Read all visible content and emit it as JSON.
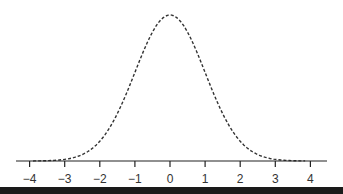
{
  "chart_data": {
    "type": "line",
    "title": "",
    "xlabel": "",
    "ylabel": "",
    "series": [
      {
        "name": "standard normal density",
        "style": "dashed",
        "color": "#333333",
        "function": "normal_pdf",
        "mean": 0,
        "sd": 1,
        "x": [
          -4,
          -3.5,
          -3,
          -2.5,
          -2,
          -1.5,
          -1,
          -0.5,
          0,
          0.5,
          1,
          1.5,
          2,
          2.5,
          3,
          3.5,
          4
        ],
        "values": [
          0.0001,
          0.0009,
          0.0044,
          0.0175,
          0.054,
          0.1295,
          0.242,
          0.3521,
          0.3989,
          0.3521,
          0.242,
          0.1295,
          0.054,
          0.0175,
          0.0044,
          0.0009,
          0.0001
        ]
      }
    ],
    "xticks": [
      -4,
      -3,
      -2,
      -1,
      0,
      1,
      2,
      3,
      4
    ],
    "xtick_labels": [
      "−4",
      "−3",
      "−2",
      "−1",
      "0",
      "1",
      "2",
      "3",
      "4"
    ],
    "xlim": [
      -4.4,
      4.5
    ],
    "ylim": [
      0,
      0.4
    ],
    "yaxis_visible": false,
    "grid": false,
    "legend": null
  },
  "colors": {
    "curve": "#333333",
    "axis": "#222222",
    "background": "#ffffff",
    "bottom_bar": "#1a1a1a"
  }
}
